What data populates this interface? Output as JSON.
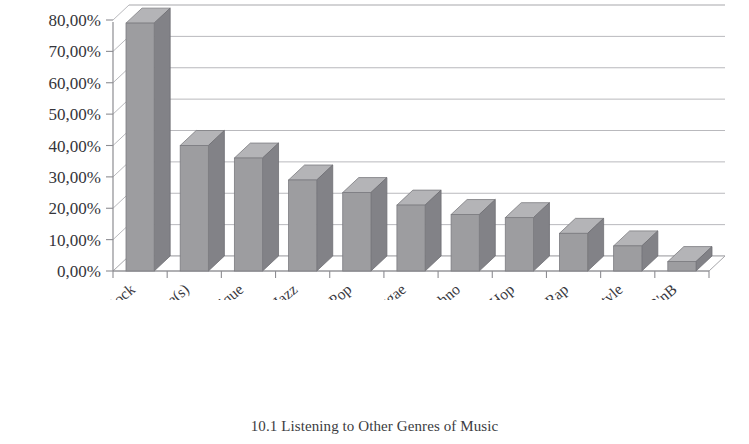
{
  "figure": {
    "caption": "10.1 Listening to Other Genres of Music"
  },
  "chart_data": {
    "type": "bar",
    "title": "",
    "subtitle": "",
    "xlabel": "",
    "ylabel": "",
    "style": "3d-column",
    "grid": true,
    "legend": false,
    "legend_position": "none",
    "decimal_separator": ",",
    "value_format": "percent",
    "ylim": [
      0,
      80
    ],
    "ytick_values": [
      0,
      10,
      20,
      30,
      40,
      50,
      60,
      70,
      80
    ],
    "ytick_labels": [
      "0,00%",
      "10,00%",
      "20,00%",
      "30,00%",
      "40,00%",
      "50,00%",
      "60,00%",
      "70,00%",
      "80,00%"
    ],
    "categories": [
      "Rock",
      "Autre(s)",
      "Classique",
      "Jazz",
      "Pop",
      "Reggae",
      "Techno",
      "Hip Hop",
      "Rap",
      "Aucun autre style",
      "R'nB"
    ],
    "values": [
      79,
      40,
      36,
      29,
      25,
      21,
      18,
      17,
      12,
      8,
      3
    ],
    "colors": {
      "bar_front": "#9d9da0",
      "bar_side": "#828287",
      "bar_top": "#b4b4b7",
      "gridline": "#b9b9bd",
      "axis": "#8d8d92",
      "text": "#35353a",
      "background": "#ffffff"
    }
  }
}
